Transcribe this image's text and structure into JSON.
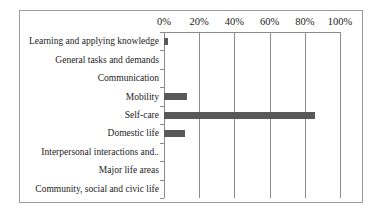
{
  "chart_data": {
    "type": "bar",
    "orientation": "horizontal",
    "title": "",
    "xlabel": "",
    "ylabel": "",
    "xlim": [
      0,
      100
    ],
    "x_ticks": [
      "0%",
      "20%",
      "40%",
      "60%",
      "80%",
      "100%"
    ],
    "grid": "vertical",
    "legend": "none",
    "bar_color": "#595959",
    "categories": [
      "Learning and applying knowledge",
      "General tasks and demands",
      "Communication",
      "Mobility",
      "Self-care",
      "Domestic life",
      "Interpersonal interactions and..",
      "Major life areas",
      "Community, social and civic life"
    ],
    "values": [
      2,
      0,
      0,
      13,
      86,
      12,
      0,
      0,
      0
    ]
  }
}
